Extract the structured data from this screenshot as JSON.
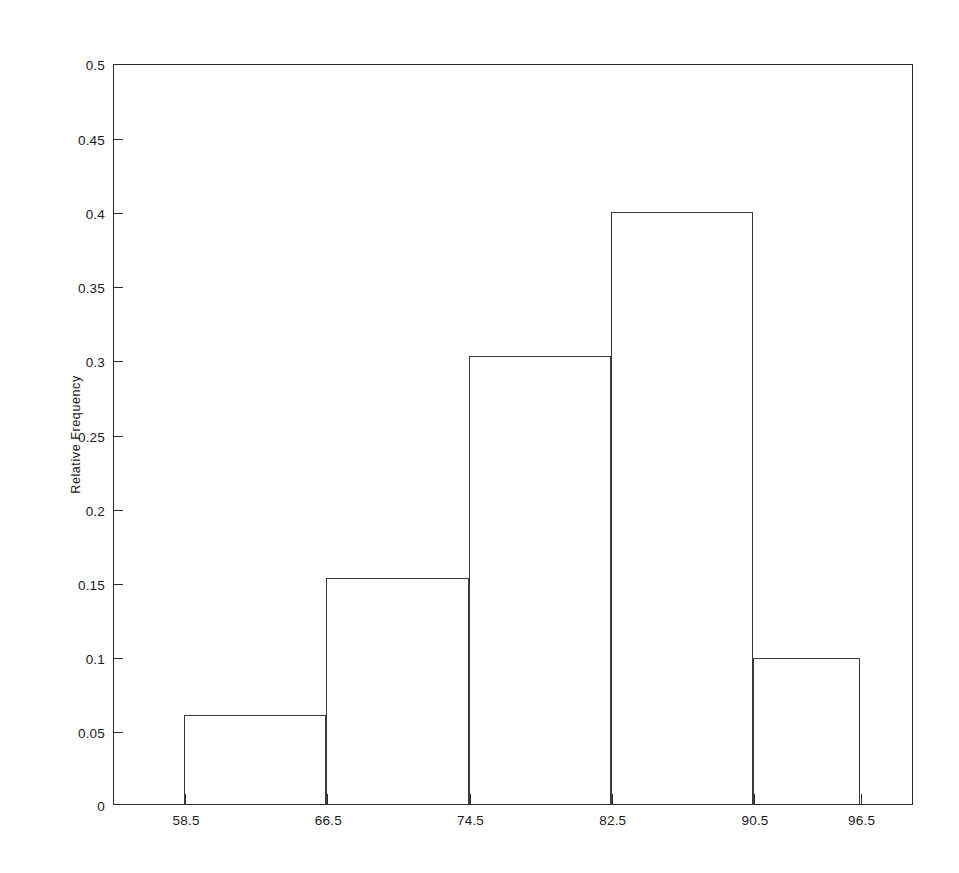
{
  "chart_data": {
    "type": "bar",
    "title": "",
    "subtitle": "",
    "xlabel": "",
    "ylabel": "Relative Frequency",
    "grid": false,
    "legend": false,
    "legend_position": "none",
    "xlim": [
      54.5,
      99.5
    ],
    "ylim": [
      0,
      0.5
    ],
    "xticks": [
      58.5,
      66.5,
      74.5,
      82.5,
      90.5,
      96.5
    ],
    "xtick_labels": [
      "58.5",
      "66.5",
      "74.5",
      "82.5",
      "90.5",
      "96.5"
    ],
    "yticks": [
      0,
      0.05,
      0.1,
      0.15,
      0.2,
      0.25,
      0.3,
      0.35,
      0.4,
      0.45,
      0.5
    ],
    "ytick_labels": [
      "0",
      "0.05",
      "0.1",
      "0.15",
      "0.2",
      "0.25",
      "0.3",
      "0.35",
      "0.4",
      "0.45",
      "0.5"
    ],
    "bin_edges": [
      58.5,
      66.5,
      74.5,
      82.5,
      90.5,
      96.5
    ],
    "categories": [
      "58.5-66.5",
      "66.5-74.5",
      "74.5-82.5",
      "82.5-90.5",
      "90.5-96.5"
    ],
    "values": [
      0.061,
      0.153,
      0.303,
      0.4,
      0.099
    ],
    "bar_style": {
      "fill": "none",
      "edge_color": "#3a3a3a",
      "edge_width": 1.3
    },
    "axes_style": {
      "frame": "full-box",
      "frame_color": "#2b2b2b",
      "background": "#ffffff"
    }
  },
  "figure": {
    "width": 959,
    "height": 873,
    "background": "#ffffff"
  }
}
